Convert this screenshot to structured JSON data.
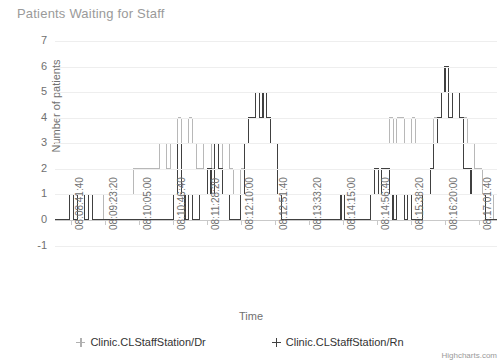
{
  "title": "Patients Waiting for Staff",
  "credits": "Highcharts.com",
  "axes": {
    "y": {
      "label": "Number of patients",
      "ticks": [
        "7",
        "6",
        "5",
        "4",
        "3",
        "2",
        "1",
        "0",
        "-1"
      ]
    },
    "x": {
      "label": "Time",
      "ticks": [
        "08:08:41:40",
        "08:09:23:20",
        "08:10:05:00",
        "08:10:46:40",
        "08:11:28:20",
        "08:12:10:00",
        "08:12:51:40",
        "08:13:33:20",
        "08:14:15:00",
        "08:14:56:40",
        "08:15:38:20",
        "08:16:20:00",
        "08:17:01:40"
      ]
    }
  },
  "legend": [
    {
      "label": "Clinic.CLStaffStation/Dr",
      "color": "#b0b0b0",
      "marker": "diamond-marker"
    },
    {
      "label": "Clinic.CLStaffStation/Rn",
      "color": "#404040",
      "marker": "plus-marker"
    }
  ],
  "chart_data": {
    "type": "line",
    "title": "Patients Waiting for Staff",
    "xlabel": "Time",
    "ylabel": "Number of patients",
    "ylim": [
      -1,
      7
    ],
    "grid": true,
    "legend_position": "bottom",
    "step": "left",
    "x_tick_labels": [
      "08:08:41:40",
      "08:09:23:20",
      "08:10:05:00",
      "08:10:46:40",
      "08:11:28:20",
      "08:12:10:00",
      "08:12:51:40",
      "08:13:33:20",
      "08:14:15:00",
      "08:14:56:40",
      "08:15:38:20",
      "08:16:20:00",
      "08:17:01:40"
    ],
    "series": [
      {
        "name": "Clinic.CLStaffStation/Dr",
        "color": "#b0b0b0",
        "x": [
          0,
          1,
          2,
          3,
          4,
          5,
          6,
          7,
          8,
          9,
          10,
          11,
          12,
          13,
          14,
          15,
          16,
          17,
          18,
          19,
          20,
          21,
          22,
          23,
          24,
          25,
          26,
          27,
          28,
          29,
          30,
          31,
          32,
          33,
          34,
          35,
          36,
          37,
          38,
          39,
          40,
          41,
          42,
          43,
          44,
          45,
          46,
          47,
          48,
          49,
          50,
          51,
          52,
          53,
          54,
          55,
          56,
          57,
          58,
          59,
          60,
          61,
          62,
          63,
          64,
          65,
          66,
          67,
          68,
          69,
          70,
          71,
          72,
          73,
          74,
          75,
          76,
          77,
          78,
          79,
          80,
          81,
          82,
          83,
          84,
          85,
          86,
          87,
          88,
          89,
          90,
          91,
          92,
          93,
          94,
          95,
          96,
          97,
          98,
          99,
          100,
          101,
          102,
          103,
          104,
          105,
          106,
          107,
          108,
          109,
          110,
          111,
          112,
          113,
          114,
          115,
          116,
          117,
          118,
          119
        ],
        "values": [
          0,
          0,
          0,
          0,
          1,
          0,
          1,
          1,
          0,
          1,
          0,
          0,
          0,
          1,
          1,
          1,
          1,
          1,
          1,
          1,
          1,
          2,
          2,
          2,
          2,
          2,
          2,
          2,
          3,
          3,
          2,
          3,
          3,
          4,
          3,
          3,
          4,
          3,
          2,
          2,
          3,
          3,
          2,
          3,
          2,
          3,
          3,
          2,
          1,
          1,
          2,
          3,
          4,
          4,
          5,
          4,
          5,
          4,
          3,
          3,
          3,
          3,
          3,
          3,
          3,
          3,
          3,
          3,
          3,
          3,
          3,
          3,
          3,
          3,
          3,
          3,
          3,
          3,
          3,
          3,
          3,
          3,
          3,
          3,
          3,
          3,
          3,
          3,
          3,
          3,
          4,
          3,
          4,
          4,
          3,
          3,
          4,
          3,
          3,
          3,
          3,
          3,
          4,
          4,
          5,
          5,
          4,
          5,
          5,
          4,
          4,
          3,
          3,
          2,
          2,
          1,
          1,
          1,
          0,
          0
        ]
      },
      {
        "name": "Clinic.CLStaffStation/Rn",
        "color": "#404040",
        "x": [
          0,
          1,
          2,
          3,
          4,
          5,
          6,
          7,
          8,
          9,
          10,
          11,
          12,
          13,
          14,
          15,
          16,
          17,
          18,
          19,
          20,
          21,
          22,
          23,
          24,
          25,
          26,
          27,
          28,
          29,
          30,
          31,
          32,
          33,
          34,
          35,
          36,
          37,
          38,
          39,
          40,
          41,
          42,
          43,
          44,
          45,
          46,
          47,
          48,
          49,
          50,
          51,
          52,
          53,
          54,
          55,
          56,
          57,
          58,
          59,
          60,
          61,
          62,
          63,
          64,
          65,
          66,
          67,
          68,
          69,
          70,
          71,
          72,
          73,
          74,
          75,
          76,
          77,
          78,
          79,
          80,
          81,
          82,
          83,
          84,
          85,
          86,
          87,
          88,
          89,
          90,
          91,
          92,
          93,
          94,
          95,
          96,
          97,
          98,
          99,
          100,
          101,
          102,
          103,
          104,
          105,
          106,
          107,
          108,
          109,
          110,
          111,
          112,
          113,
          114,
          115,
          116,
          117,
          118,
          119
        ],
        "values": [
          0,
          0,
          0,
          0,
          1,
          0,
          1,
          1,
          0,
          1,
          0,
          0,
          0,
          0,
          0,
          0,
          0,
          0,
          0,
          0,
          0,
          0,
          0,
          0,
          0,
          0,
          0,
          0,
          0,
          0,
          0,
          0,
          1,
          3,
          1,
          0,
          1,
          0,
          0,
          1,
          1,
          2,
          1,
          3,
          2,
          1,
          1,
          0,
          0,
          0,
          1,
          3,
          4,
          4,
          5,
          4,
          5,
          4,
          3,
          3,
          1,
          0,
          0,
          0,
          0,
          0,
          0,
          0,
          0,
          0,
          0,
          0,
          0,
          0,
          0,
          0,
          0,
          1,
          0,
          0,
          0,
          0,
          0,
          0,
          0,
          1,
          2,
          1,
          2,
          2,
          1,
          0,
          1,
          1,
          0,
          1,
          0,
          0,
          0,
          1,
          1,
          2,
          3,
          4,
          5,
          6,
          4,
          5,
          5,
          4,
          2,
          2,
          1,
          1,
          1,
          1,
          0,
          0,
          0,
          0
        ]
      }
    ]
  }
}
